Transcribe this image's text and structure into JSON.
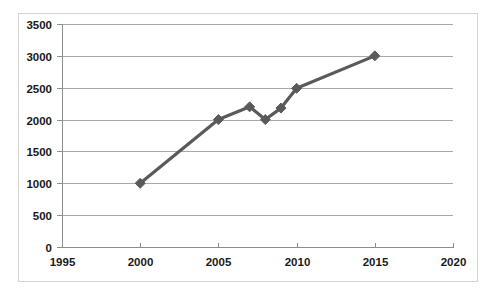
{
  "chart_data": {
    "type": "line",
    "title": "",
    "subtitle": "",
    "xlabel": "",
    "ylabel": "",
    "xlim": [
      1995,
      2020
    ],
    "ylim": [
      0,
      3500
    ],
    "grid": true,
    "legend": false,
    "legend_position": "none",
    "series_color": "#5a5a5a",
    "marker": "diamond",
    "xticks": [
      1995,
      2000,
      2005,
      2010,
      2015,
      2020
    ],
    "xtick_labels": [
      "1995",
      "2000",
      "2005",
      "2010",
      "2015",
      "2020"
    ],
    "yticks": [
      0,
      500,
      1000,
      1500,
      2000,
      2500,
      3000,
      3500
    ],
    "ytick_labels": [
      "0",
      "500",
      "1000",
      "1500",
      "2000",
      "2500",
      "3000",
      "3500"
    ],
    "series": [
      {
        "name": "series-1",
        "x": [
          2000,
          2005,
          2007,
          2008,
          2009,
          2010,
          2015
        ],
        "values": [
          1000,
          2000,
          2200,
          2000,
          2180,
          2490,
          3000
        ]
      }
    ]
  }
}
